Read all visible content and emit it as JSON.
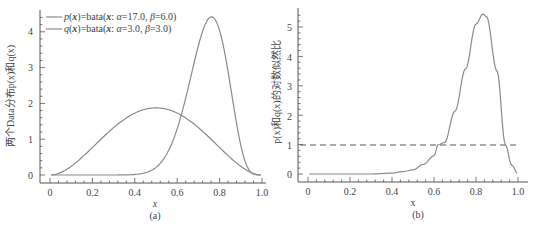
{
  "chart_data": [
    {
      "type": "line",
      "panel_label": "(a)",
      "title": "",
      "xlabel": "x",
      "ylabel": "两个Data分布p(x)和q(x)",
      "xlim": [
        0,
        1.0
      ],
      "ylim": [
        0,
        4.5
      ],
      "xticks": [
        "0",
        "0.2",
        "0.4",
        "0.6",
        "0.8",
        "1.0"
      ],
      "yticks": [
        "0",
        "1",
        "2",
        "3",
        "4"
      ],
      "grid": false,
      "legend_position": "upper-left",
      "series": [
        {
          "name": "p(x)=bata(x: α=17.0, β=6.0)",
          "distribution": "beta",
          "alpha": 17.0,
          "beta": 6.0,
          "x": [
            0,
            0.3,
            0.4,
            0.5,
            0.55,
            0.6,
            0.65,
            0.7,
            0.75,
            0.762,
            0.8,
            0.85,
            0.9,
            0.95,
            1.0
          ],
          "values": [
            0,
            0.0,
            0.05,
            0.26,
            0.58,
            1.08,
            1.84,
            2.83,
            3.96,
            4.42,
            4.17,
            3.15,
            1.36,
            0.22,
            0
          ]
        },
        {
          "name": "q(x)=bata(x: α=3.0, β=3.0)",
          "distribution": "beta",
          "alpha": 3.0,
          "beta": 3.0,
          "x": [
            0,
            0.1,
            0.2,
            0.3,
            0.4,
            0.5,
            0.6,
            0.7,
            0.8,
            0.9,
            1.0
          ],
          "values": [
            0,
            0.24,
            0.77,
            1.32,
            1.73,
            1.875,
            1.73,
            1.32,
            0.77,
            0.24,
            0
          ]
        }
      ],
      "legend": [
        {
          "label_parts": [
            "p",
            "(",
            "x",
            ")=bata(",
            "x",
            ": ",
            "α",
            "=17.0, ",
            "β",
            "=6.0)"
          ],
          "label": "p(x)=bata(x: α=17.0, β=6.0)"
        },
        {
          "label_parts": [
            "q",
            "(",
            "x",
            ")=bata(",
            "x",
            ": ",
            "α",
            "=3.0, ",
            "β",
            "=3.0)"
          ],
          "label": "q(x)=bata(x: α=3.0, β=3.0)"
        }
      ]
    },
    {
      "type": "line",
      "panel_label": "(b)",
      "title": "",
      "xlabel": "x",
      "ylabel": "p(x)和q(x)的对数似然比",
      "xlim": [
        0,
        1.0
      ],
      "ylim": [
        0,
        5.6
      ],
      "xticks": [
        "0",
        "0.2",
        "0.4",
        "0.6",
        "0.8",
        "1.0"
      ],
      "yticks": [
        "0",
        "1",
        "2",
        "3",
        "4",
        "5"
      ],
      "grid": false,
      "series": [
        {
          "name": "p(x)/q(x)",
          "style": "solid",
          "x": [
            0,
            0.3,
            0.4,
            0.45,
            0.5,
            0.55,
            0.6,
            0.62,
            0.65,
            0.7,
            0.75,
            0.8,
            0.833,
            0.85,
            0.9,
            0.94,
            0.97,
            1.0
          ],
          "values": [
            0,
            0.0,
            0.03,
            0.08,
            0.14,
            0.33,
            0.62,
            1.0,
            1.07,
            2.14,
            3.57,
            5.1,
            5.44,
            5.35,
            3.5,
            1.0,
            0.3,
            0
          ]
        },
        {
          "name": "y=1 reference",
          "style": "dashed",
          "x": [
            0,
            1.0
          ],
          "values": [
            1,
            1
          ]
        }
      ]
    }
  ],
  "panels": {
    "a": {
      "label": "(a)",
      "xlabel": "x",
      "ylabel": "两个Data分布p(x)和q(x)",
      "xticks": [
        "0",
        "0.2",
        "0.4",
        "0.6",
        "0.8",
        "1.0"
      ],
      "yticks": [
        "0",
        "1",
        "2",
        "3",
        "4"
      ],
      "legend": {
        "p": {
          "fn": "p",
          "open": "(",
          "var": "x",
          "mid": ")=bata(",
          "var2": "x",
          "sep": ": ",
          "a": "α",
          "av": "=17.0, ",
          "b": "β",
          "bv": "=6.0)"
        },
        "q": {
          "fn": "q",
          "open": "(",
          "var": "x",
          "mid": ")=bata(",
          "var2": "x",
          "sep": ": ",
          "a": "α",
          "av": "=3.0, ",
          "b": "β",
          "bv": "=3.0)"
        }
      }
    },
    "b": {
      "label": "(b)",
      "xlabel": "x",
      "ylabel": "p(x)和q(x)的对数似然比",
      "xticks": [
        "0",
        "0.2",
        "0.4",
        "0.6",
        "0.8",
        "1.0"
      ],
      "yticks": [
        "0",
        "1",
        "2",
        "3",
        "4",
        "5"
      ]
    }
  },
  "colors": {
    "curve": "#8a8a8a",
    "axis": "#555555",
    "text": "#444444"
  }
}
